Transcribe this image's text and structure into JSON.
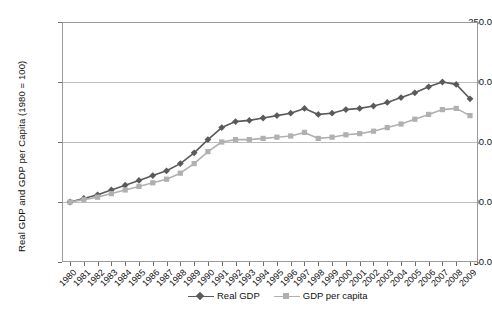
{
  "chart_data": {
    "type": "line",
    "title": "",
    "xlabel": "",
    "ylabel": "Real GDP and GDP per Capita (1980 = 100)",
    "ylim": [
      50.0,
      250.0
    ],
    "y_ticks": [
      "50.0",
      "100.0",
      "150.0",
      "200.0",
      "250.0"
    ],
    "grid": true,
    "legend_position": "bottom-center",
    "x": [
      "1980",
      "1981",
      "1982",
      "1983",
      "1984",
      "1985",
      "1986",
      "1987",
      "1988",
      "1989",
      "1990",
      "1991",
      "1992",
      "1993",
      "1994",
      "1995",
      "1996",
      "1997",
      "1998",
      "1999",
      "2000",
      "2001",
      "2002",
      "2003",
      "2004",
      "2005",
      "2006",
      "2007",
      "2008",
      "2009"
    ],
    "series": [
      {
        "name": "Real GDP",
        "marker": "diamond",
        "color": "#5a5a5a",
        "values": [
          100,
          103,
          106,
          110,
          114,
          118,
          122,
          126,
          132,
          141,
          152,
          162,
          167,
          168,
          170,
          172,
          174,
          178,
          173,
          174,
          177,
          178,
          180,
          183,
          187,
          191,
          196,
          200,
          198,
          186
        ]
      },
      {
        "name": "GDP per capita",
        "marker": "square",
        "color": "#b0b0b0",
        "values": [
          100,
          102,
          104,
          107,
          110,
          113,
          116,
          119,
          124,
          132,
          142,
          150,
          152,
          152,
          153,
          154,
          155,
          158,
          153,
          154,
          156,
          157,
          159,
          162,
          165,
          169,
          173,
          177,
          178,
          172
        ]
      }
    ]
  },
  "legend": {
    "entries": [
      {
        "label": "Real GDP"
      },
      {
        "label": "GDP per capita"
      }
    ]
  },
  "colors": {
    "series_real_gdp": "#5a5a5a",
    "series_per_capita": "#b0b0b0",
    "gridline": "#bdbdbd",
    "frame": "#9a9a9a",
    "text": "#111111",
    "background": "#ffffff"
  }
}
